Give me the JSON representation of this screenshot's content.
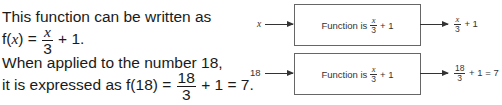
{
  "text": {
    "line1": "This function can be written as",
    "line2_prefix": "f(",
    "line2_var": "x",
    "line2_mid": ") = ",
    "line2_frac_num": "x",
    "line2_frac_den": "3",
    "line2_suffix": " + 1.",
    "line3": "When applied to the number 18,",
    "line4_prefix": "it is expressed as f(18) = ",
    "line4_frac_num": "18",
    "line4_frac_den": "3",
    "line4_suffix": " + 1 = 7."
  },
  "diagram": {
    "rows": [
      {
        "input": "x",
        "box_prefix": "Function is",
        "box_frac_num": "x",
        "box_frac_den": "3",
        "box_suffix": "+ 1",
        "out_frac_num": "x",
        "out_frac_den": "3",
        "out_suffix": "+ 1"
      },
      {
        "input": "18",
        "box_prefix": "Function is",
        "box_frac_num": "x",
        "box_frac_den": "3",
        "box_suffix": "+ 1",
        "out_frac_num": "18",
        "out_frac_den": "3",
        "out_suffix": "+ 1 = 7"
      }
    ]
  }
}
